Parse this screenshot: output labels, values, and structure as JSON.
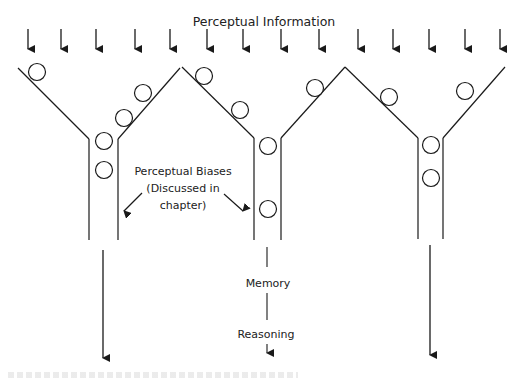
{
  "diagram": {
    "title": "Perceptual Information",
    "colors": {
      "stroke": "#1a1a1a",
      "background": "#ffffff"
    },
    "input_arrows_x": [
      28,
      61,
      96,
      135,
      170,
      207,
      243,
      281,
      319,
      358,
      393,
      429,
      465,
      500
    ],
    "funnels": [
      {
        "name": "funnel-1",
        "left_rim": [
          18,
          68
        ],
        "right_rim": [
          180,
          68
        ],
        "tube_left": 89,
        "tube_right": 118,
        "tube_top": 139,
        "tube_bottom": 240,
        "circles": [
          [
            37,
            72
          ],
          [
            143,
            93
          ],
          [
            124,
            118
          ],
          [
            104,
            141
          ],
          [
            104,
            170
          ]
        ]
      },
      {
        "name": "funnel-2",
        "left_rim": [
          182,
          67
        ],
        "right_rim": [
          345,
          67
        ],
        "tube_left": 254,
        "tube_right": 281,
        "tube_top": 138,
        "tube_bottom": 240,
        "circles": [
          [
            204,
            76
          ],
          [
            240,
            110
          ],
          [
            268,
            146
          ],
          [
            315,
            88
          ],
          [
            268,
            209
          ]
        ]
      },
      {
        "name": "funnel-3",
        "left_rim": [
          345,
          67
        ],
        "right_rim": [
          505,
          67
        ],
        "tube_left": 418,
        "tube_right": 443,
        "tube_top": 138,
        "tube_bottom": 239,
        "circles": [
          [
            389,
            97
          ],
          [
            465,
            91
          ],
          [
            431,
            145
          ],
          [
            431,
            178
          ]
        ]
      }
    ],
    "bias_label": {
      "lines": [
        "Perceptual Biases",
        "(Discussed in",
        "chapter)"
      ]
    },
    "stages": {
      "memory": "Memory",
      "reasoning": "Reasoning"
    },
    "output_arrows": [
      {
        "x": 103,
        "y1": 250,
        "y2": 358
      },
      {
        "x": 430,
        "y1": 245,
        "y2": 355
      }
    ]
  }
}
